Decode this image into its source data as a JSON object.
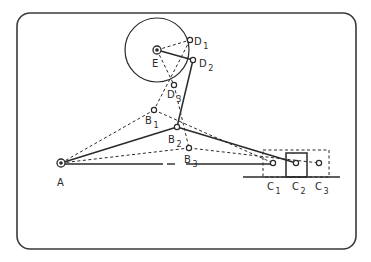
{
  "frame": {
    "x": 17,
    "y": 13,
    "w": 339,
    "h": 236,
    "r": 13,
    "stroke": "#3a3a3a"
  },
  "colors": {
    "ink": "#2a2a2a",
    "paper": "#ffffff"
  },
  "points": {
    "A": {
      "x": 61,
      "y": 163,
      "label": "A",
      "sub": ""
    },
    "E": {
      "x": 157,
      "y": 50,
      "label": "E",
      "sub": ""
    },
    "D1": {
      "x": 190,
      "y": 40,
      "label": "D",
      "sub": "1"
    },
    "D2": {
      "x": 193,
      "y": 60,
      "label": "D",
      "sub": "2"
    },
    "D3": {
      "x": 174,
      "y": 85,
      "label": "D",
      "sub": "3"
    },
    "B1": {
      "x": 154,
      "y": 110,
      "label": "B",
      "sub": "1"
    },
    "B2": {
      "x": 177,
      "y": 127,
      "label": "B",
      "sub": "2"
    },
    "B3": {
      "x": 189,
      "y": 148,
      "label": "B",
      "sub": "3"
    },
    "C1": {
      "x": 273,
      "y": 163,
      "label": "C",
      "sub": "1"
    },
    "C2": {
      "x": 296,
      "y": 163,
      "label": "C",
      "sub": "2"
    },
    "C3": {
      "x": 319,
      "y": 163,
      "label": "C",
      "sub": "3"
    }
  },
  "crank_circle": {
    "cx": 157,
    "cy": 50,
    "r": 32
  },
  "slider_block": {
    "x": 286,
    "y": 153,
    "w": 21,
    "h": 24
  },
  "slider_envelope": {
    "x": 263,
    "y": 150,
    "w": 66,
    "h": 27
  },
  "ground_line": {
    "x1": 243,
    "y1": 177,
    "x2": 340,
    "y2": 177
  },
  "links": [
    {
      "from": "E",
      "to": "D2",
      "style": "solid"
    },
    {
      "from": "E",
      "to": "D1",
      "style": "dashed"
    },
    {
      "from": "E",
      "to": "D3",
      "style": "dashed"
    },
    {
      "from": "D2",
      "to": "B2",
      "style": "solid"
    },
    {
      "from": "D1",
      "to": "B1",
      "style": "dashed"
    },
    {
      "from": "D3",
      "to": "B3",
      "style": "dashed"
    },
    {
      "from": "A",
      "to": "B2",
      "style": "solid"
    },
    {
      "from": "A",
      "to": "B1",
      "style": "dashed"
    },
    {
      "from": "A",
      "to": "B3",
      "style": "dashed"
    },
    {
      "from": "B2",
      "to": "C2",
      "style": "solid"
    },
    {
      "from": "B1",
      "to": "C1",
      "style": "dashed"
    },
    {
      "from": "B3",
      "to": "C3",
      "style": "dashed"
    }
  ],
  "centerline_segments": [
    {
      "x1": 61,
      "x2": 163
    },
    {
      "x1": 167,
      "x2": 175
    },
    {
      "x1": 186,
      "x2": 275
    }
  ],
  "centerline_y": 164,
  "labels": {
    "A": {
      "x": 57,
      "y": 186
    },
    "E": {
      "x": 152,
      "y": 67
    },
    "D1": {
      "x": 194,
      "y": 45
    },
    "D2": {
      "x": 199,
      "y": 67
    },
    "D3": {
      "x": 167,
      "y": 98
    },
    "B1": {
      "x": 145,
      "y": 124
    },
    "B2": {
      "x": 168,
      "y": 143
    },
    "B3": {
      "x": 184,
      "y": 163
    },
    "C1": {
      "x": 267,
      "y": 190
    },
    "C2": {
      "x": 292,
      "y": 190
    },
    "C3": {
      "x": 315,
      "y": 190
    }
  }
}
